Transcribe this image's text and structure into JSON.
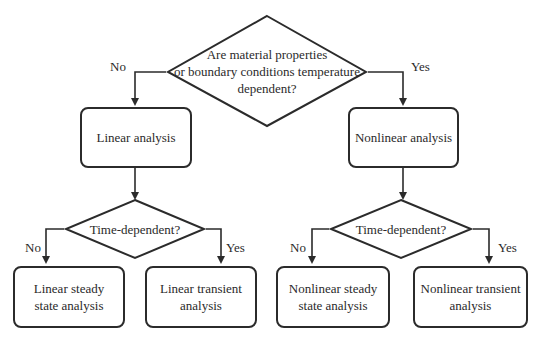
{
  "diagram": {
    "type": "flowchart",
    "colors": {
      "stroke": "#2b2b2b",
      "text": "#2a2a2a",
      "background": "#ffffff"
    },
    "root_decision": {
      "lines": [
        "Are material properties",
        "or boundary conditions temperature",
        "dependent?"
      ]
    },
    "branches": {
      "no_label": "No",
      "yes_label": "Yes"
    },
    "left": {
      "process": "Linear analysis",
      "decision": "Time-dependent?",
      "no_label": "No",
      "yes_label": "Yes",
      "outcome_no": [
        "Linear steady",
        "state analysis"
      ],
      "outcome_yes": [
        "Linear transient",
        "analysis"
      ]
    },
    "right": {
      "process": "Nonlinear analysis",
      "decision": "Time-dependent?",
      "no_label": "No",
      "yes_label": "Yes",
      "outcome_no": [
        "Nonlinear steady",
        "state analysis"
      ],
      "outcome_yes": [
        "Nonlinear transient",
        "analysis"
      ]
    }
  }
}
